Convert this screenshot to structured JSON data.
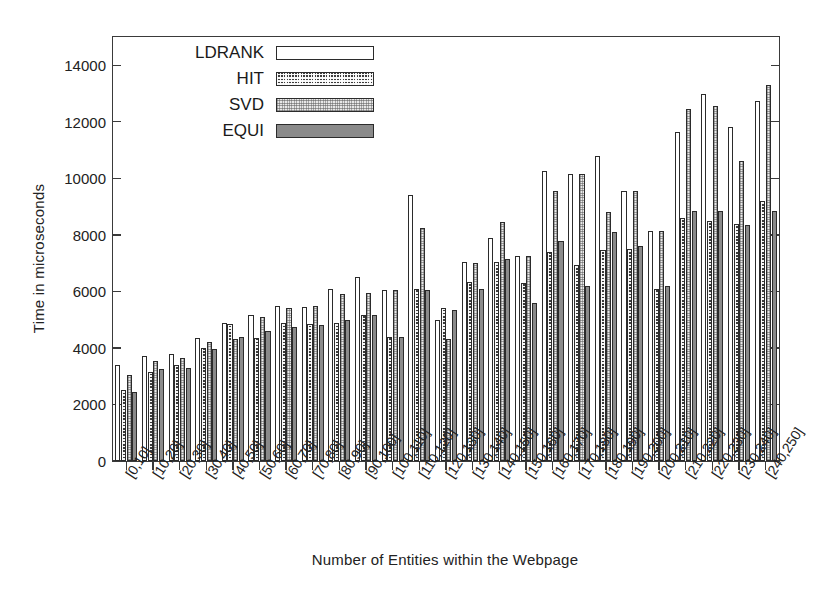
{
  "chart_data": {
    "type": "bar",
    "title": "",
    "xlabel": "Number of Entities within the Webpage",
    "ylabel": "Time in microseconds",
    "ylim": [
      0,
      15000
    ],
    "yticks": [
      0,
      2000,
      4000,
      6000,
      8000,
      10000,
      12000,
      14000
    ],
    "ytick_labels": [
      "0",
      "2000",
      "4000",
      "6000",
      "8000",
      "10000",
      "12000",
      "14000"
    ],
    "grid": false,
    "legend_position": "upper-left-inside",
    "categories": [
      "[0,10]",
      "[10,20]",
      "[20,30]",
      "[30,40]",
      "[40,50]",
      "[50,60]",
      "[60,70]",
      "[70,80]",
      "[80,90]",
      "[90,100]",
      "[100,110]",
      "[110,120]",
      "[120,130]",
      "[130,140]",
      "[140,150]",
      "[150,160]",
      "[160,170]",
      "[170,180]",
      "[180,190]",
      "[190,200]",
      "[200,210]",
      "[210,220]",
      "[220,230]",
      "[230,240]",
      "[240,250]"
    ],
    "series": [
      {
        "name": "LDRANK",
        "fill": "empty",
        "values": [
          3400,
          3700,
          3800,
          4350,
          4900,
          5150,
          5500,
          5450,
          6100,
          6500,
          6050,
          9400,
          5000,
          7050,
          7900,
          7250,
          10250,
          10150,
          10800,
          9550,
          8150,
          11650,
          13000,
          11800,
          12750
        ]
      },
      {
        "name": "HIT",
        "fill": "checker",
        "values": [
          2500,
          3150,
          3400,
          4000,
          4850,
          4350,
          4900,
          4850,
          4900,
          5150,
          4400,
          6100,
          5400,
          6350,
          7050,
          6300,
          7400,
          6950,
          7450,
          7500,
          6100,
          8600,
          8500,
          8400,
          9200
        ]
      },
      {
        "name": "SVD",
        "fill": "stipple",
        "values": [
          3050,
          3550,
          3650,
          4200,
          4300,
          5100,
          5400,
          5500,
          5900,
          5950,
          6050,
          8250,
          4300,
          7000,
          8450,
          7250,
          9550,
          10150,
          8800,
          9550,
          8150,
          12450,
          12550,
          10600,
          13300
        ]
      },
      {
        "name": "EQUI",
        "fill": "solid",
        "values": [
          2450,
          3250,
          3300,
          3950,
          4400,
          4600,
          4750,
          4800,
          5000,
          5150,
          4400,
          6050,
          5350,
          6100,
          7150,
          5600,
          7800,
          6200,
          8100,
          7600,
          6200,
          8850,
          8850,
          8350,
          8850
        ]
      }
    ]
  },
  "legend": {
    "items": [
      {
        "label": "LDRANK",
        "fill": "empty"
      },
      {
        "label": "HIT",
        "fill": "checker"
      },
      {
        "label": "SVD",
        "fill": "stipple"
      },
      {
        "label": "EQUI",
        "fill": "solid"
      }
    ]
  },
  "colors": {
    "axis": "#3a3a3a",
    "text": "#1a1a1a",
    "ldrank": "#ffffff",
    "hit": "#3c3c3c",
    "svd": "#e9e9e9",
    "equi": "#8a8a8a"
  }
}
